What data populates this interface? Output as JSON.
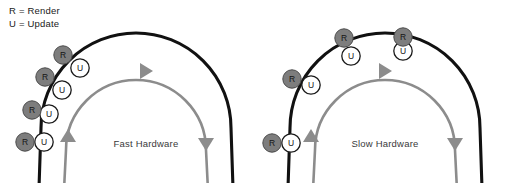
{
  "figure": {
    "width": 505,
    "height": 183,
    "background": "#ffffff"
  },
  "legend": {
    "render_entry": "R = Render",
    "update_entry": "U = Update",
    "render_symbol": "R",
    "update_symbol": "U"
  },
  "colors": {
    "outer_arc": "#111111",
    "inner_arc": "#8c8c8c",
    "render_marker_fill": "#7d7d7d",
    "render_marker_stroke": "#4a4a4a",
    "update_marker_fill": "#ffffff",
    "update_marker_stroke": "#1a1a1a",
    "label_text": "#3a3a3a",
    "legend_text": "#1a1a1a"
  },
  "panels": [
    {
      "id": "fast-hardware",
      "label": "Fast Hardware",
      "label_x": 146,
      "label_y": 147,
      "outer_arc": {
        "cx": 136,
        "cy": 128,
        "r": 95,
        "stroke_width": 3.1
      },
      "inner_arc": {
        "cx": 136,
        "cy": 150,
        "r": 70,
        "stroke_width": 2.6
      },
      "arrow_top": {
        "x": 140,
        "y": 71,
        "rotation": 0
      },
      "arrow_left": {
        "x": 68,
        "y": 142,
        "rotation": -90
      },
      "arrow_right": {
        "x": 206,
        "y": 138,
        "rotation": 90
      },
      "markers": [
        {
          "render": {
            "x": 63,
            "y": 55
          },
          "update": {
            "x": 80,
            "y": 68
          }
        },
        {
          "render": {
            "x": 45,
            "y": 77
          },
          "update": {
            "x": 62,
            "y": 90
          }
        },
        {
          "render": {
            "x": 32,
            "y": 110
          },
          "update": {
            "x": 49,
            "y": 114
          }
        },
        {
          "render": {
            "x": 25,
            "y": 142
          },
          "update": {
            "x": 44,
            "y": 142
          }
        }
      ]
    },
    {
      "id": "slow-hardware",
      "label": "Slow Hardware",
      "label_x": 385,
      "label_y": 147,
      "outer_arc": {
        "cx": 385,
        "cy": 128,
        "r": 95,
        "stroke_width": 3.1
      },
      "inner_arc": {
        "cx": 385,
        "cy": 150,
        "r": 70,
        "stroke_width": 2.6
      },
      "arrow_top": {
        "x": 379,
        "y": 71,
        "rotation": 0
      },
      "arrow_left": {
        "x": 311,
        "y": 142,
        "rotation": -90
      },
      "arrow_right": {
        "x": 455,
        "y": 138,
        "rotation": 90
      },
      "markers": [
        {
          "render": {
            "x": 403,
            "y": 37
          },
          "update": {
            "x": 403,
            "y": 51
          }
        },
        {
          "render": {
            "x": 344,
            "y": 38
          },
          "update": {
            "x": 351,
            "y": 56
          }
        },
        {
          "render": {
            "x": 292,
            "y": 79
          },
          "update": {
            "x": 311,
            "y": 85
          }
        },
        {
          "render": {
            "x": 272,
            "y": 143
          },
          "update": {
            "x": 291,
            "y": 143
          }
        }
      ]
    }
  ],
  "marker_geometry": {
    "radius": 9.2,
    "render_stroke_width": 1.0,
    "update_stroke_width": 1.3
  },
  "arrow_geometry": {
    "half_width": 8,
    "length": 13
  }
}
